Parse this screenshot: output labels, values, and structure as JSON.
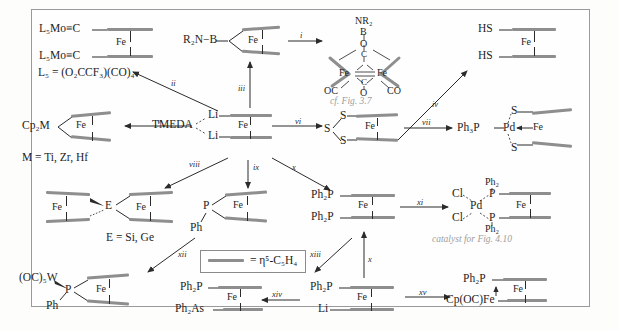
{
  "figure": {
    "type": "reaction-scheme",
    "legend": {
      "bar_meaning": "= η⁵-C₅H₄"
    },
    "notes": [
      {
        "id": "note-fig37",
        "text": "cf. Fig. 3.7"
      },
      {
        "id": "note-catalyst",
        "text": "catalyst for Fig. 4.10"
      }
    ],
    "structures": {
      "mo_carbyne": {
        "top_label": "L₅Mo≡C",
        "bottom_label": "L₅Mo≡C",
        "metal": "Fe",
        "footnote": "L₅ = (O₂CCF₃)(CO)₄"
      },
      "boron_amide": {
        "left_label": "R₂N−B",
        "metal": "Fe"
      },
      "diiron_boron": {
        "apex": "NR₂",
        "b": "B",
        "o": "O",
        "fe_left": "Fe",
        "fe_right": "Fe",
        "c_top": "C",
        "c_bottom": "C",
        "o_bottom": "O",
        "oc_left": "OC",
        "co_right": "CO"
      },
      "dithiol": {
        "top_label": "HS",
        "bottom_label": "HS",
        "metal": "Fe"
      },
      "cp2m": {
        "left_label": "Cp₂M",
        "metal": "Fe",
        "footnote": "M = Ti, Zr, Hf"
      },
      "dilithio": {
        "top_label": "Li",
        "bottom_label": "Li",
        "metal": "Fe",
        "base": "TMEDA"
      },
      "trisulfide": {
        "s_top": "S",
        "s_left": "S",
        "s_bottom": "S",
        "metal": "Fe"
      },
      "pd_dithiolate": {
        "phosphine": "Ph₃P",
        "pd": "Pd",
        "s_top": "S",
        "s_bottom": "S",
        "metal": "Fe"
      },
      "sila_bridge": {
        "fe_left": "Fe",
        "bridge": "E",
        "fe_right": "Fe",
        "footnote": "E = Si, Ge"
      },
      "phosphaferrocenophane": {
        "p": "P",
        "ph": "Ph",
        "metal": "Fe"
      },
      "dppf": {
        "top_label": "Ph₂P",
        "bottom_label": "Ph₂P",
        "metal": "Fe"
      },
      "pdcl2dppf": {
        "cl_top": "Cl",
        "cl_bottom": "Cl",
        "pd": "Pd",
        "p_top": "P",
        "p_bottom": "P",
        "ph2_top": "Ph₂",
        "ph2_bottom": "Ph₂",
        "metal": "Fe"
      },
      "w_phosphine": {
        "w_label": "(OC)₅W",
        "p": "P",
        "ph": "Ph",
        "metal": "Fe"
      },
      "p_as_ferrocene": {
        "top_label": "Ph₂P",
        "bottom_label": "Ph₂As",
        "metal": "Fe"
      },
      "p_li_ferrocene": {
        "top_label": "Ph₂P",
        "bottom_label": "Li",
        "metal": "Fe"
      },
      "p_feCp": {
        "top_label": "Ph₂P",
        "bottom_label": "Cp(OC)Fe",
        "metal": "Fe"
      }
    },
    "arrows": [
      {
        "id": "arrow-i",
        "label": "i"
      },
      {
        "id": "arrow-ii",
        "label": "ii"
      },
      {
        "id": "arrow-iii",
        "label": "iii"
      },
      {
        "id": "arrow-iv",
        "label": "iv"
      },
      {
        "id": "arrow-v",
        "label": "v"
      },
      {
        "id": "arrow-vi",
        "label": "vi"
      },
      {
        "id": "arrow-vii",
        "label": "vii"
      },
      {
        "id": "arrow-viii",
        "label": "viii"
      },
      {
        "id": "arrow-ix",
        "label": "ix"
      },
      {
        "id": "arrow-x-top",
        "label": "x"
      },
      {
        "id": "arrow-xi",
        "label": "xi"
      },
      {
        "id": "arrow-xii",
        "label": "xii"
      },
      {
        "id": "arrow-xiii",
        "label": "xiii"
      },
      {
        "id": "arrow-xiv",
        "label": "xiv"
      },
      {
        "id": "arrow-xv",
        "label": "xv"
      },
      {
        "id": "arrow-x-bottom",
        "label": "x"
      }
    ]
  }
}
